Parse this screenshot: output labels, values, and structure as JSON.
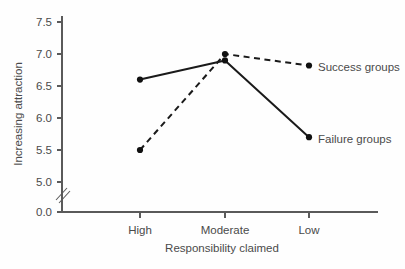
{
  "chart_data": {
    "type": "line",
    "title": "",
    "xlabel": "Responsibility claimed",
    "ylabel": "Increasing attraction",
    "categories": [
      "High",
      "Moderate",
      "Low"
    ],
    "ylim": [
      5.0,
      7.5
    ],
    "yticks": [
      "0.0",
      "5.0",
      "5.5",
      "6.0",
      "6.5",
      "7.0",
      "7.5"
    ],
    "ytick_values": [
      0.0,
      5.0,
      5.5,
      6.0,
      6.5,
      7.0,
      7.5
    ],
    "axis_break": true,
    "grid": false,
    "legend_position": "inline-right",
    "series": [
      {
        "name": "Success groups",
        "style": "dashed",
        "values": [
          5.5,
          7.0,
          6.82
        ],
        "color": "#1a1a1a"
      },
      {
        "name": "Failure groups",
        "style": "solid",
        "values": [
          6.6,
          6.9,
          5.7
        ],
        "color": "#1a1a1a"
      }
    ]
  },
  "axes": {
    "y_label": "Increasing attraction",
    "x_label": "Responsibility claimed",
    "y_ticks": [
      {
        "label": "7.5",
        "value": 7.5
      },
      {
        "label": "7.0",
        "value": 7.0
      },
      {
        "label": "6.5",
        "value": 6.5
      },
      {
        "label": "6.0",
        "value": 6.0
      },
      {
        "label": "5.5",
        "value": 5.5
      },
      {
        "label": "5.0",
        "value": 5.0
      },
      {
        "label": "0.0",
        "value": 0.0
      }
    ],
    "x_ticks": [
      {
        "label": "High"
      },
      {
        "label": "Moderate"
      },
      {
        "label": "Low"
      }
    ]
  },
  "series_labels": {
    "success": "Success groups",
    "failure": "Failure groups"
  },
  "colors": {
    "line": "#1a1a1a",
    "axis": "#5a5a5a",
    "text": "#4a4a4a",
    "background": "#fefefe"
  }
}
